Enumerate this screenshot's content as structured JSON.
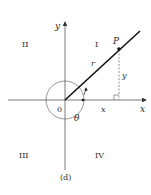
{
  "figure": {
    "caption": "(d)",
    "axes": {
      "x_label": "x",
      "y_label": "y",
      "origin_label": "0"
    },
    "quadrants": {
      "q1": "I",
      "q2": "II",
      "q3": "III",
      "q4": "IV"
    },
    "point_label": "P",
    "radius_label": "r",
    "angle_label": "θ",
    "x_component_label": "x",
    "y_component_label": "y",
    "colors": {
      "ink": "#2a2a2a",
      "line": "#111111",
      "thin": "#555555"
    }
  }
}
